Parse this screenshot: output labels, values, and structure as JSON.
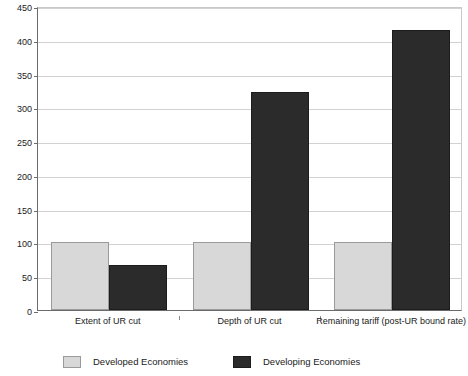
{
  "chart_data": {
    "type": "bar",
    "title": "",
    "subtitle": "",
    "xlabel": "",
    "ylabel": "",
    "categories": [
      "Extent of UR cut",
      "Depth of UR cut",
      "Remaining tariff (post-UR bound rate)"
    ],
    "series": [
      {
        "name": "Developed Economies",
        "color": "#d8d8d8",
        "values": [
          100,
          100,
          100
        ]
      },
      {
        "name": "Developing Economies",
        "color": "#2b2b2b",
        "values": [
          66,
          322,
          415
        ]
      }
    ],
    "ylim": [
      0,
      450
    ],
    "ytick_values": [
      0,
      50,
      100,
      150,
      200,
      250,
      300,
      350,
      400,
      450
    ],
    "ytick_labels": [
      "0",
      "50",
      "100",
      "150",
      "200",
      "250",
      "300",
      "350",
      "400",
      "450"
    ],
    "grid": true,
    "grid_axis": "y",
    "legend_position": "bottom"
  },
  "legend": {
    "items": [
      {
        "label": "Developed Economies",
        "swatch": "developed"
      },
      {
        "label": "Developing Economies",
        "swatch": "developing"
      }
    ]
  }
}
